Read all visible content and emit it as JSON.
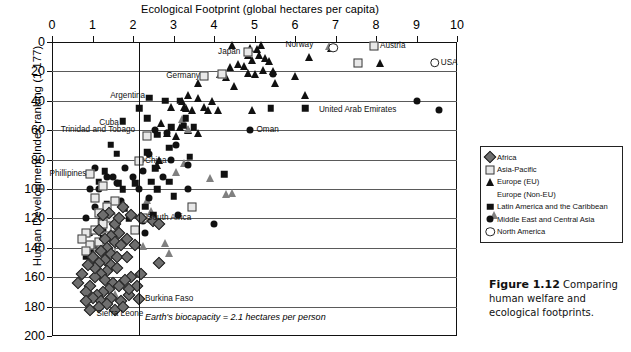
{
  "chart_data": {
    "type": "scatter",
    "title": "Ecological Footprint (global hectares per capita)",
    "xlabel": "Ecological Footprint (global hectares per capita)",
    "ylabel": "Human Development Index ranking (1-177)",
    "xlim": [
      0,
      10
    ],
    "ylim": [
      0,
      200
    ],
    "y_inverted": true,
    "xticks": [
      0,
      1,
      2,
      3,
      4,
      5,
      6,
      7,
      8,
      9,
      10
    ],
    "yticks": [
      0,
      20,
      40,
      60,
      80,
      100,
      120,
      140,
      160,
      180,
      200
    ],
    "grid": "horizontal",
    "legend_position": "right-middle",
    "annotation_line": {
      "text": "Earth's biocapacity = 2.1 hectares per person",
      "x": 2.15,
      "orientation": "vertical"
    },
    "legend": [
      {
        "name": "Africa",
        "marker": "diamond-gray"
      },
      {
        "name": "Asia-Pacific",
        "marker": "square-open"
      },
      {
        "name": "Europe (EU)",
        "marker": "triangle-black"
      },
      {
        "name": "Europe (Non-EU)",
        "marker": "triangle-gray"
      },
      {
        "name": "Latin America and the Caribbean",
        "marker": "square-black"
      },
      {
        "name": "Middle East and Central Asia",
        "marker": "circle-black"
      },
      {
        "name": "North America",
        "marker": "circle-open"
      }
    ],
    "point_labels": [
      {
        "label": "Japan",
        "x": 4.75,
        "y": 7,
        "anchor": "right"
      },
      {
        "label": "Norway",
        "x": 6.55,
        "y": 2,
        "anchor": "right"
      },
      {
        "label": "Austria",
        "x": 7.95,
        "y": 3,
        "anchor": "left"
      },
      {
        "label": "USA",
        "x": 9.45,
        "y": 14,
        "anchor": "left"
      },
      {
        "label": "Germany",
        "x": 3.75,
        "y": 23,
        "anchor": "right"
      },
      {
        "label": "Argentina",
        "x": 2.4,
        "y": 37,
        "anchor": "right"
      },
      {
        "label": "Cuba",
        "x": 1.75,
        "y": 55,
        "anchor": "right"
      },
      {
        "label": "Trinidad and Tobago",
        "x": 2.15,
        "y": 60,
        "anchor": "right"
      },
      {
        "label": "United Arab Emirates",
        "x": 8.6,
        "y": 46,
        "anchor": "right"
      },
      {
        "label": "Oman",
        "x": 4.9,
        "y": 60,
        "anchor": "left"
      },
      {
        "label": "China",
        "x": 2.15,
        "y": 81,
        "anchor": "left"
      },
      {
        "label": "Phillipines",
        "x": 0.95,
        "y": 90,
        "anchor": "right"
      },
      {
        "label": "South Africa",
        "x": 2.2,
        "y": 120,
        "anchor": "left"
      },
      {
        "label": "Burkina Faso",
        "x": 2.15,
        "y": 175,
        "anchor": "left"
      },
      {
        "label": "Sierra Leone",
        "x": 0.95,
        "y": 185,
        "anchor": "left"
      }
    ],
    "series": [
      {
        "name": "Europe (EU)",
        "marker": "triangle-black",
        "points": [
          [
            4.9,
            4
          ],
          [
            5.05,
            5
          ],
          [
            4.85,
            9
          ],
          [
            5.1,
            9
          ],
          [
            5.25,
            11
          ],
          [
            4.95,
            12
          ],
          [
            5.35,
            13
          ],
          [
            6.35,
            10
          ],
          [
            6.9,
            4
          ],
          [
            4.6,
            15
          ],
          [
            4.75,
            16
          ],
          [
            5.2,
            19
          ],
          [
            5.45,
            20
          ],
          [
            4.4,
            17
          ],
          [
            4.85,
            21
          ],
          [
            5.0,
            22
          ],
          [
            4.15,
            22
          ],
          [
            4.3,
            24
          ],
          [
            6.0,
            23
          ],
          [
            8.1,
            14
          ],
          [
            4.5,
            30
          ],
          [
            3.35,
            36
          ],
          [
            3.6,
            38
          ],
          [
            3.95,
            40
          ],
          [
            3.2,
            40
          ],
          [
            6.25,
            36
          ],
          [
            3.25,
            44
          ],
          [
            3.3,
            45
          ],
          [
            3.45,
            46
          ],
          [
            3.75,
            44
          ],
          [
            4.1,
            46
          ],
          [
            2.95,
            44
          ],
          [
            2.7,
            55
          ],
          [
            3.15,
            58
          ],
          [
            3.35,
            60
          ],
          [
            3.6,
            62
          ],
          [
            3.85,
            46
          ],
          [
            2.85,
            62
          ],
          [
            3.05,
            64
          ],
          [
            4.95,
            46
          ],
          [
            2.65,
            80
          ],
          [
            2.6,
            84
          ],
          [
            3.6,
            28
          ],
          [
            5.5,
            28
          ],
          [
            4.45,
            2
          ],
          [
            5.15,
            2
          ]
        ]
      },
      {
        "name": "Europe (Non-EU)",
        "marker": "triangle-gray",
        "points": [
          [
            6.85,
            3
          ],
          [
            3.2,
            47
          ],
          [
            3.35,
            48
          ],
          [
            3.25,
            66
          ],
          [
            3.05,
            67
          ],
          [
            3.9,
            65
          ],
          [
            4.45,
            70
          ],
          [
            4.3,
            65
          ],
          [
            2.35,
            64
          ],
          [
            2.45,
            66
          ],
          [
            2.8,
            82
          ],
          [
            2.9,
            84
          ],
          [
            1.55,
            106
          ],
          [
            2.25,
            68
          ]
        ]
      },
      {
        "name": "Latin America and the Caribbean",
        "marker": "square-black",
        "points": [
          [
            2.4,
            38
          ],
          [
            2.35,
            52
          ],
          [
            1.75,
            54
          ],
          [
            2.8,
            40
          ],
          [
            3.15,
            40
          ],
          [
            3.3,
            52
          ],
          [
            3.25,
            57
          ],
          [
            3.5,
            58
          ],
          [
            2.95,
            58
          ],
          [
            2.6,
            63
          ],
          [
            2.9,
            72
          ],
          [
            2.35,
            75
          ],
          [
            1.45,
            70
          ],
          [
            1.6,
            76
          ],
          [
            1.3,
            88
          ],
          [
            1.15,
            95
          ],
          [
            3.4,
            78
          ],
          [
            2.9,
            95
          ],
          [
            2.6,
            100
          ],
          [
            2.05,
            96
          ],
          [
            1.75,
            100
          ],
          [
            1.35,
            110
          ],
          [
            2.3,
            112
          ],
          [
            2.5,
            118
          ],
          [
            1.9,
            120
          ],
          [
            1.6,
            124
          ],
          [
            1.5,
            130
          ],
          [
            1.25,
            133
          ],
          [
            1.05,
            138
          ],
          [
            0.95,
            142
          ],
          [
            0.85,
            146
          ],
          [
            2.55,
            86
          ],
          [
            4.25,
            90
          ],
          [
            3.0,
            105
          ],
          [
            1.8,
            113
          ],
          [
            5.4,
            45
          ],
          [
            6.25,
            45
          ],
          [
            1.2,
            122
          ],
          [
            2.15,
            45
          ],
          [
            2.45,
            95
          ],
          [
            1.65,
            96
          ]
        ]
      },
      {
        "name": "Middle East and Central Asia",
        "marker": "circle-black",
        "points": [
          [
            9.0,
            40
          ],
          [
            9.55,
            46
          ],
          [
            4.9,
            60
          ],
          [
            5.45,
            22
          ],
          [
            2.55,
            60
          ],
          [
            2.85,
            62
          ],
          [
            3.05,
            70
          ],
          [
            2.4,
            76
          ],
          [
            2.95,
            80
          ],
          [
            3.35,
            84
          ],
          [
            2.2,
            80
          ],
          [
            2.25,
            88
          ],
          [
            2.0,
            92
          ],
          [
            1.6,
            96
          ],
          [
            1.35,
            92
          ],
          [
            1.15,
            100
          ],
          [
            2.75,
            92
          ],
          [
            3.35,
            100
          ],
          [
            2.15,
            100
          ],
          [
            2.4,
            106
          ],
          [
            1.7,
            108
          ],
          [
            1.05,
            112
          ],
          [
            1.25,
            116
          ],
          [
            0.85,
            120
          ],
          [
            2.25,
            122
          ],
          [
            3.1,
            118
          ],
          [
            1.5,
            124
          ],
          [
            1.25,
            128
          ],
          [
            0.95,
            130
          ],
          [
            1.5,
            92
          ],
          [
            1.8,
            86
          ],
          [
            4.0,
            124
          ],
          [
            2.3,
            130
          ],
          [
            1.05,
            86
          ],
          [
            1.45,
            134
          ],
          [
            0.95,
            100
          ]
        ]
      },
      {
        "name": "Asia-Pacific",
        "marker": "square-open",
        "points": [
          [
            4.85,
            7
          ],
          [
            7.95,
            3
          ],
          [
            7.55,
            14
          ],
          [
            3.75,
            23
          ],
          [
            4.2,
            22
          ],
          [
            2.35,
            64
          ],
          [
            2.15,
            81
          ],
          [
            0.95,
            90
          ],
          [
            1.25,
            98
          ],
          [
            1.05,
            106
          ],
          [
            1.55,
            108
          ],
          [
            1.35,
            112
          ],
          [
            1.15,
            116
          ],
          [
            1.45,
            120
          ],
          [
            1.25,
            124
          ],
          [
            1.05,
            128
          ],
          [
            0.85,
            130
          ],
          [
            1.35,
            132
          ],
          [
            1.15,
            136
          ],
          [
            0.95,
            138
          ],
          [
            1.45,
            140
          ],
          [
            1.25,
            142
          ],
          [
            0.75,
            134
          ],
          [
            2.25,
            120
          ],
          [
            3.45,
            112
          ],
          [
            1.55,
            126
          ],
          [
            0.85,
            142
          ],
          [
            2.05,
            128
          ],
          [
            1.15,
            144
          ]
        ]
      },
      {
        "name": "North America",
        "marker": "circle-open",
        "points": [
          [
            9.45,
            14
          ],
          [
            6.95,
            4
          ]
        ]
      },
      {
        "name": "Africa",
        "marker": "diamond-gray",
        "points": [
          [
            2.2,
            120
          ],
          [
            2.5,
            122
          ],
          [
            2.65,
            124
          ],
          [
            1.75,
            112
          ],
          [
            1.95,
            118
          ],
          [
            1.4,
            116
          ],
          [
            1.55,
            124
          ],
          [
            1.65,
            130
          ],
          [
            1.45,
            132
          ],
          [
            1.3,
            134
          ],
          [
            1.55,
            136
          ],
          [
            1.7,
            138
          ],
          [
            1.35,
            140
          ],
          [
            1.2,
            142
          ],
          [
            1.45,
            144
          ],
          [
            1.6,
            146
          ],
          [
            1.3,
            148
          ],
          [
            1.15,
            150
          ],
          [
            1.45,
            152
          ],
          [
            1.6,
            154
          ],
          [
            1.35,
            156
          ],
          [
            1.2,
            158
          ],
          [
            1.05,
            160
          ],
          [
            1.3,
            162
          ],
          [
            1.5,
            164
          ],
          [
            1.65,
            166
          ],
          [
            1.4,
            168
          ],
          [
            1.25,
            170
          ],
          [
            1.1,
            172
          ],
          [
            0.95,
            166
          ],
          [
            0.85,
            170
          ],
          [
            1.0,
            174
          ],
          [
            1.2,
            176
          ],
          [
            1.45,
            174
          ],
          [
            1.7,
            176
          ],
          [
            1.9,
            172
          ],
          [
            2.15,
            175
          ],
          [
            1.35,
            178
          ],
          [
            1.15,
            180
          ],
          [
            0.95,
            182
          ],
          [
            1.55,
            182
          ],
          [
            1.75,
            180
          ],
          [
            0.85,
            176
          ],
          [
            2.65,
            150
          ],
          [
            1.85,
            146
          ],
          [
            1.65,
            120
          ],
          [
            2.2,
            158
          ],
          [
            1.95,
            160
          ],
          [
            1.8,
            162
          ],
          [
            2.1,
            166
          ],
          [
            1.9,
            168
          ],
          [
            0.75,
            158
          ],
          [
            0.65,
            164
          ],
          [
            1.05,
            154
          ],
          [
            1.15,
            128
          ],
          [
            1.85,
            134
          ],
          [
            2.05,
            138
          ],
          [
            1.0,
            146
          ],
          [
            0.9,
            152
          ],
          [
            1.25,
            118
          ]
        ]
      }
    ]
  },
  "caption": {
    "figure_number": "Figure 1.12",
    "text": "Comparing human welfare and ecological footprints."
  }
}
